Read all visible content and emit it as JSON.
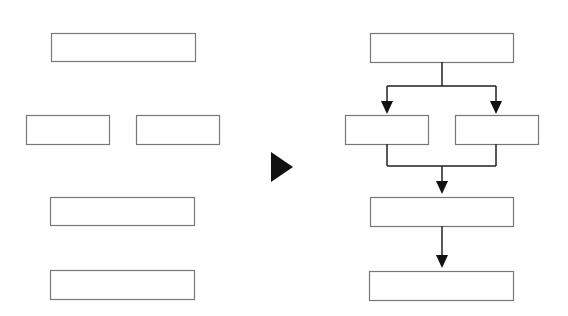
{
  "diagram": {
    "title": "",
    "colors": {
      "box_stroke": "#777777",
      "line": "#222222",
      "arrow": "#111111",
      "background": "#ffffff"
    },
    "left_group": {
      "label": "unconnected-boxes",
      "boxes": [
        {
          "id": "L1",
          "x": 51,
          "y": 33,
          "w": 144,
          "h": 28,
          "text": ""
        },
        {
          "id": "L2",
          "x": 26,
          "y": 115,
          "w": 83,
          "h": 29,
          "text": ""
        },
        {
          "id": "L3",
          "x": 136,
          "y": 115,
          "w": 83,
          "h": 29,
          "text": ""
        },
        {
          "id": "L4",
          "x": 50,
          "y": 197,
          "w": 144,
          "h": 28,
          "text": ""
        },
        {
          "id": "L5",
          "x": 50,
          "y": 270,
          "w": 144,
          "h": 29,
          "text": ""
        }
      ]
    },
    "transition_arrow": {
      "points": "271,152 293,167 271,182"
    },
    "right_group": {
      "label": "connected-flowchart",
      "boxes": [
        {
          "id": "R1",
          "x": 370,
          "y": 33,
          "w": 143,
          "h": 29,
          "text": ""
        },
        {
          "id": "R2",
          "x": 345,
          "y": 115,
          "w": 83,
          "h": 29,
          "text": ""
        },
        {
          "id": "R3",
          "x": 455,
          "y": 115,
          "w": 83,
          "h": 29,
          "text": ""
        },
        {
          "id": "R4",
          "x": 370,
          "y": 197,
          "w": 143,
          "h": 29,
          "text": ""
        },
        {
          "id": "R5",
          "x": 369,
          "y": 271,
          "w": 144,
          "h": 29,
          "text": ""
        }
      ],
      "connectors": [
        {
          "id": "split",
          "path": "M442 62 V86 M387 86 H496 M387 86 V102 M496 86 V102"
        },
        {
          "id": "merge",
          "path": "M387 144 V166 M496 144 V166 M387 166 H496 M442 166 V182"
        },
        {
          "id": "seq",
          "path": "M442 226 V256"
        }
      ],
      "arrowheads": [
        {
          "id": "to-R2",
          "points": "381,101 393,101 387,114"
        },
        {
          "id": "to-R3",
          "points": "490,101 502,101 496,114"
        },
        {
          "id": "to-R4",
          "points": "436,181 448,181 442,194"
        },
        {
          "id": "to-R5",
          "points": "436,255 448,255 442,268"
        }
      ]
    }
  }
}
